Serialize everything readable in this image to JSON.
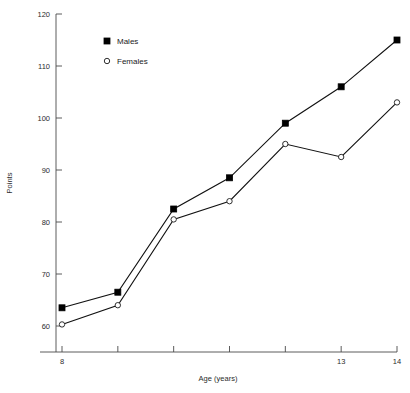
{
  "chart_data": {
    "type": "line",
    "title": "",
    "subtitle": "",
    "xlabel": "Age (years)",
    "ylabel": "Points",
    "x": [
      8,
      9,
      10,
      11,
      12,
      13,
      14
    ],
    "xlim": [
      8,
      14
    ],
    "ylim": [
      60,
      120
    ],
    "grid": false,
    "legend_position": "top-left-inside",
    "x_tick_values": [
      8,
      9,
      10,
      11,
      12,
      13,
      14
    ],
    "x_tick_labels": [
      "8",
      "",
      "",
      "",
      "",
      "13",
      "14"
    ],
    "y_tick_values": [
      60,
      70,
      80,
      90,
      100,
      110,
      120
    ],
    "y_tick_labels": [
      "60",
      "70",
      "80",
      "90",
      "100",
      "110",
      "120"
    ],
    "series": [
      {
        "name": "Males",
        "marker": "filled-square",
        "color": "#000000",
        "values": [
          63.5,
          66.5,
          82.5,
          88.5,
          99,
          106,
          115
        ]
      },
      {
        "name": "Females",
        "marker": "open-circle",
        "color": "#000000",
        "values": [
          60.3,
          64,
          80.5,
          84,
          95,
          92.5,
          103
        ]
      }
    ]
  },
  "legend": {
    "entries": [
      {
        "label": "Males",
        "marker": "filled-square"
      },
      {
        "label": "Females",
        "marker": "open-circle"
      }
    ]
  },
  "axes": {
    "y_title": "Points",
    "x_title": "Age (years)"
  }
}
